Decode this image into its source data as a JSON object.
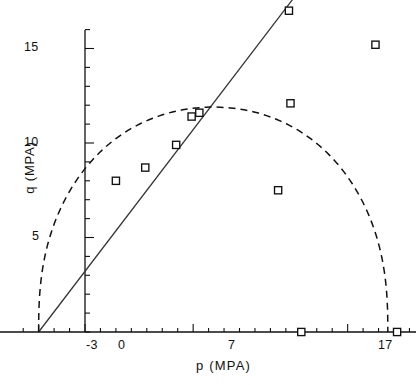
{
  "chart_data": {
    "type": "scatter",
    "title": "",
    "xlabel": "p  (MPA)",
    "ylabel": "q (MPA)",
    "xlim": [
      -3.8,
      21.5
    ],
    "ylim": [
      -0.6,
      18.2
    ],
    "xticks": [
      -3,
      0,
      7,
      17
    ],
    "yticks": [
      5,
      10,
      15
    ],
    "xtick_labels": [
      "-3",
      "0",
      "7",
      "17"
    ],
    "ytick_labels": [
      "5",
      "10",
      "15"
    ],
    "minor_tick_step_x": 1,
    "minor_tick_step_y": 1,
    "grid": false,
    "legend": null,
    "series": [
      {
        "name": "test data",
        "type": "scatter",
        "marker": "open-square",
        "points": [
          {
            "x": 2.0,
            "y": 8.0
          },
          {
            "x": 3.9,
            "y": 8.7
          },
          {
            "x": 5.9,
            "y": 9.9
          },
          {
            "x": 6.9,
            "y": 11.4
          },
          {
            "x": 7.4,
            "y": 11.6
          },
          {
            "x": 12.5,
            "y": 7.5
          },
          {
            "x": 13.2,
            "y": 17.0
          },
          {
            "x": 13.3,
            "y": 12.1
          },
          {
            "x": 18.8,
            "y": 15.2
          },
          {
            "x": 14.0,
            "y": 0.0
          },
          {
            "x": 20.2,
            "y": 0.0
          }
        ]
      },
      {
        "name": "critical state line",
        "type": "line",
        "style": "solid",
        "x_start": -3.0,
        "y_start": 0.0,
        "x_end": 14.0,
        "y_end": 18.2,
        "slope": 1.13,
        "intercept": 4.8
      },
      {
        "name": "yield locus",
        "type": "line",
        "style": "dashed",
        "shape": "ellipse",
        "x_start": -3.0,
        "x_end": 19.6,
        "apex_x": 10.0,
        "apex_y": 11.9
      }
    ]
  },
  "axes": {
    "y_label": "q (MPA)",
    "x_label": "p  (MPA)",
    "x_tick_0": "0",
    "x_tick_m3": "-3",
    "x_tick_7": "7",
    "x_tick_17": "17",
    "y_tick_5": "5",
    "y_tick_10": "10",
    "y_tick_15": "15"
  },
  "colors": {
    "ink": "#111111",
    "background": "#ffffff"
  }
}
